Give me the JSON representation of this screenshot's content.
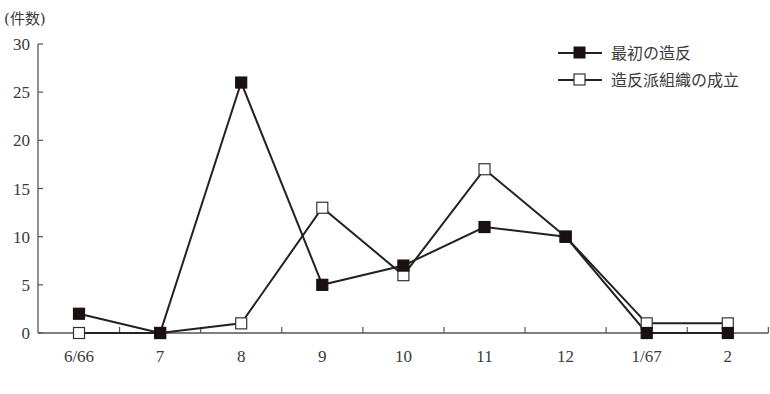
{
  "chart_data": {
    "type": "line",
    "title": "",
    "xlabel": "",
    "ylabel": "(件数)",
    "ylim": [
      0,
      30
    ],
    "yticks": [
      0,
      5,
      10,
      15,
      20,
      25,
      30
    ],
    "ytick_labels": [
      "0",
      "5",
      "10",
      "15",
      "20",
      "25",
      "30"
    ],
    "categories": [
      "6/66",
      "7",
      "8",
      "9",
      "10",
      "11",
      "12",
      "1/67",
      "2"
    ],
    "grid": false,
    "legend_position": "top-right",
    "series": [
      {
        "name": "最初の造反",
        "marker": "filled-square",
        "color": "#1a1010",
        "values": [
          2,
          0,
          26,
          5,
          7,
          11,
          10,
          0,
          0
        ]
      },
      {
        "name": "造反派組織の成立",
        "marker": "open-square",
        "color": "#333333",
        "values": [
          0,
          0,
          1,
          13,
          6,
          17,
          10,
          1,
          1
        ]
      }
    ]
  }
}
